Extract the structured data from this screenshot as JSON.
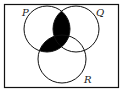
{
  "diagram": {
    "type": "venn",
    "sets": [
      {
        "label": "P"
      },
      {
        "label": "Q"
      },
      {
        "label": "R"
      }
    ],
    "shaded_region": "P ∩ (Q ∪ R)",
    "colors": {
      "line": "#111111",
      "shade": "#000000",
      "background": "#ffffff"
    }
  }
}
